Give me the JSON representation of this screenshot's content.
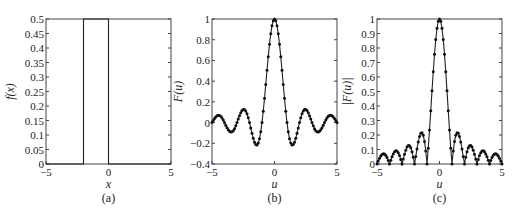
{
  "chart_data": [
    {
      "type": "line",
      "panel": "a",
      "caption": "(a)",
      "xlabel": "x",
      "ylabel": "f(x)",
      "xlim": [
        -5,
        5
      ],
      "ylim": [
        0,
        0.5
      ],
      "xticks": [
        "-5",
        "0",
        "5"
      ],
      "yticks": [
        "0",
        "0.05",
        "0.1",
        "0.15",
        "0.2",
        "0.25",
        "0.3",
        "0.35",
        "0.4",
        "0.45",
        "0.5"
      ],
      "markers": false,
      "description": "Rectangular pulse: f(x) = 0.5 for -2 <= x <= 0, else 0",
      "x": [
        -5,
        -2,
        -2,
        0,
        0,
        5
      ],
      "y": [
        0,
        0,
        0.5,
        0.5,
        0,
        0
      ]
    },
    {
      "type": "line",
      "panel": "b",
      "caption": "(b)",
      "xlabel": "u",
      "ylabel": "F(u)",
      "xlim": [
        -5,
        5
      ],
      "ylim": [
        -0.4,
        1
      ],
      "xticks": [
        "-5",
        "0",
        "5"
      ],
      "yticks": [
        "-0.4",
        "-0.2",
        "0",
        "0.2",
        "0.4",
        "0.6",
        "0.8",
        "1"
      ],
      "markers": true,
      "description": "Sinc-shaped spectrum F(u) = sin(pi u)/(pi u), sampled every 0.1",
      "x": [
        -5,
        -4.5,
        -3.5,
        -2.5,
        -1.43,
        -1,
        0,
        1,
        1.43,
        2.5,
        3.5,
        4.5,
        5
      ],
      "y": [
        0,
        0.071,
        -0.091,
        0.127,
        -0.217,
        0,
        1,
        0,
        -0.217,
        0.127,
        -0.091,
        0.071,
        0
      ]
    },
    {
      "type": "line",
      "panel": "c",
      "caption": "(c)",
      "xlabel": "u",
      "ylabel": "|F(u)|",
      "xlim": [
        -5,
        5
      ],
      "ylim": [
        0,
        1
      ],
      "xticks": [
        "-5",
        "0",
        "5"
      ],
      "yticks": [
        "0",
        "0.1",
        "0.2",
        "0.3",
        "0.4",
        "0.5",
        "0.6",
        "0.7",
        "0.8",
        "0.9",
        "1"
      ],
      "markers": true,
      "description": "Magnitude spectrum |F(u)| = |sin(pi u)/(pi u)|, sampled every 0.1",
      "x": [
        -5,
        -4.5,
        -4,
        -3.5,
        -3,
        -2.5,
        -2,
        -1.43,
        -1,
        0,
        1,
        1.43,
        2,
        2.5,
        3,
        3.5,
        4,
        4.5,
        5
      ],
      "y": [
        0,
        0.071,
        0,
        0.091,
        0,
        0.127,
        0,
        0.217,
        0,
        1,
        0,
        0.217,
        0,
        0.127,
        0,
        0.091,
        0,
        0.071,
        0
      ]
    }
  ]
}
